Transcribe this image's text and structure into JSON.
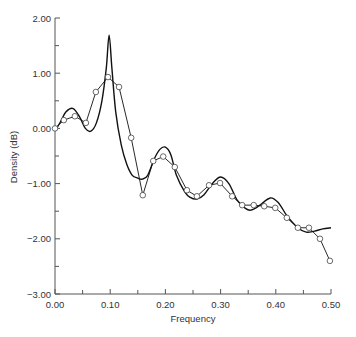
{
  "chart_data": {
    "type": "line",
    "title": "",
    "xlabel": "Frequency",
    "ylabel": "Density (dB)",
    "xlim": [
      0.0,
      0.5
    ],
    "ylim": [
      -3.0,
      2.0
    ],
    "x_ticks": [
      "0.00",
      "0.10",
      "0.20",
      "0.30",
      "0.40",
      "0.50"
    ],
    "x_tick_values": [
      0.0,
      0.1,
      0.2,
      0.3,
      0.4,
      0.5
    ],
    "x_minor_ticks": [
      0.05,
      0.15,
      0.25,
      0.35,
      0.45
    ],
    "y_ticks": [
      "2.00",
      "1.00",
      "0.00",
      "−1.00",
      "−2.00",
      "−3.00"
    ],
    "y_tick_values": [
      2.0,
      1.0,
      0.0,
      -1.0,
      -2.0,
      -3.0
    ],
    "y_minor_ticks": [
      1.5,
      0.5,
      -0.5,
      -1.5,
      -2.5
    ],
    "grid": false,
    "legend": null,
    "series": [
      {
        "name": "smooth spectral estimate",
        "style": "solid line, no markers",
        "x": [
          0.0,
          0.01,
          0.02,
          0.033,
          0.045,
          0.055,
          0.065,
          0.075,
          0.085,
          0.093,
          0.098,
          0.103,
          0.11,
          0.12,
          0.13,
          0.14,
          0.15,
          0.158,
          0.168,
          0.18,
          0.19,
          0.2,
          0.21,
          0.22,
          0.235,
          0.245,
          0.257,
          0.27,
          0.285,
          0.3,
          0.315,
          0.33,
          0.345,
          0.355,
          0.37,
          0.39,
          0.405,
          0.42,
          0.44,
          0.455,
          0.47,
          0.485,
          0.5
        ],
        "y": [
          -0.05,
          0.12,
          0.3,
          0.36,
          0.2,
          0.0,
          -0.05,
          0.1,
          0.5,
          1.1,
          1.69,
          1.1,
          0.3,
          -0.3,
          -0.65,
          -0.85,
          -0.9,
          -0.92,
          -0.85,
          -0.55,
          -0.38,
          -0.34,
          -0.48,
          -0.85,
          -1.15,
          -1.25,
          -1.28,
          -1.2,
          -1.0,
          -0.88,
          -1.0,
          -1.3,
          -1.45,
          -1.48,
          -1.4,
          -1.26,
          -1.35,
          -1.58,
          -1.8,
          -1.88,
          -1.86,
          -1.82,
          -1.8
        ]
      },
      {
        "name": "raw estimate (markers)",
        "style": "polyline with open circle markers",
        "x": [
          0.0,
          0.016,
          0.036,
          0.056,
          0.074,
          0.096,
          0.116,
          0.138,
          0.159,
          0.178,
          0.196,
          0.217,
          0.239,
          0.257,
          0.279,
          0.299,
          0.321,
          0.339,
          0.36,
          0.379,
          0.399,
          0.42,
          0.44,
          0.46,
          0.48,
          0.498
        ],
        "y": [
          0.0,
          0.15,
          0.22,
          0.1,
          0.66,
          0.93,
          0.75,
          -0.17,
          -1.21,
          -0.59,
          -0.51,
          -0.7,
          -1.12,
          -1.23,
          -1.03,
          -0.99,
          -1.23,
          -1.39,
          -1.39,
          -1.41,
          -1.44,
          -1.62,
          -1.8,
          -1.8,
          -2.0,
          -2.4
        ]
      }
    ]
  },
  "labels": {
    "xlabel": "Frequency",
    "ylabel": "Density (dB)"
  },
  "colors": {
    "line": "#111111",
    "axis": "#555555",
    "marker_fill": "#ffffff",
    "text": "#333333"
  }
}
